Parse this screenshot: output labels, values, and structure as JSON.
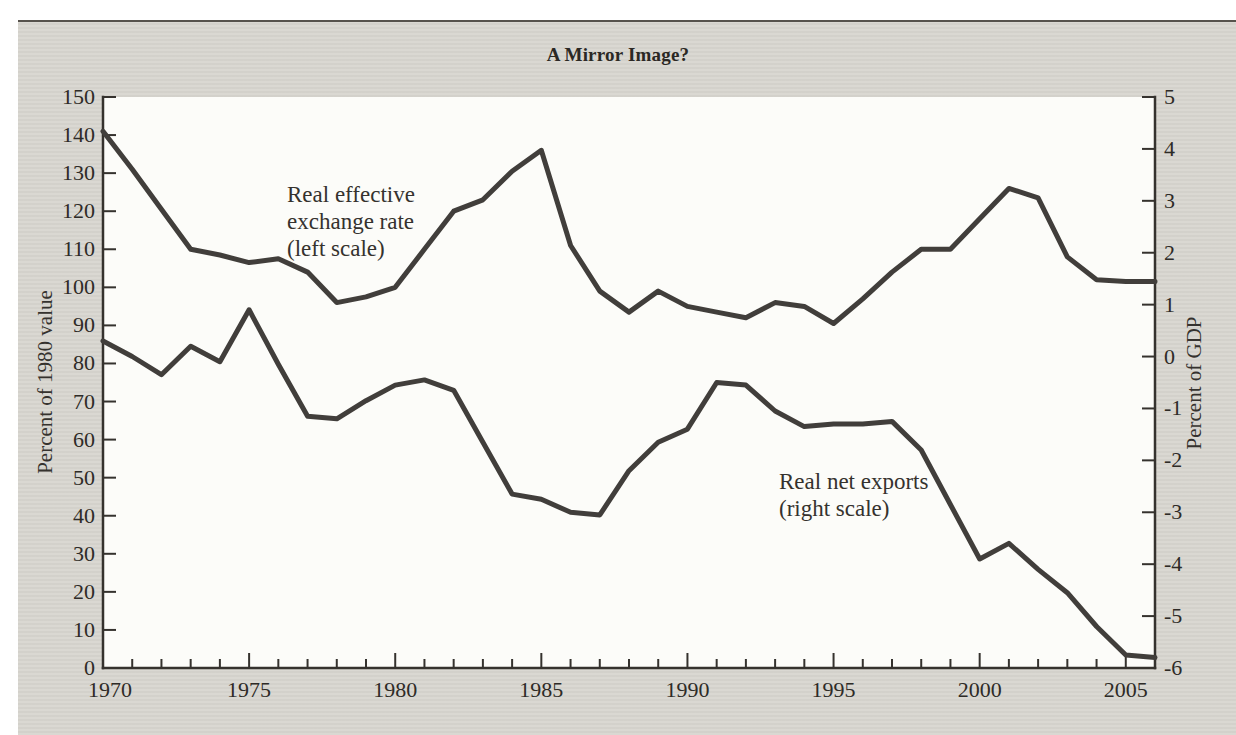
{
  "page": {
    "background": "#ffffff",
    "panel_background": "#d8d6d0",
    "plot_background": "#fcfcf9",
    "rule_color": "#56524c",
    "text_color": "#35322e",
    "line_color": "#413e3b"
  },
  "figure": {
    "title": "A Mirror Image?",
    "left_axis_title": "Percent of 1980 value",
    "right_axis_title": "Percent of GDP",
    "annotation_left_series": "Real effective\nexchange rate\n(left scale)",
    "annotation_right_series": "Real net exports\n(right scale)"
  },
  "chart_data": {
    "type": "line",
    "title": "A Mirror Image?",
    "grid": false,
    "legend_position": "inline-annotations",
    "x": [
      1970,
      1971,
      1972,
      1973,
      1974,
      1975,
      1976,
      1977,
      1978,
      1979,
      1980,
      1981,
      1982,
      1983,
      1984,
      1985,
      1986,
      1987,
      1988,
      1989,
      1990,
      1991,
      1992,
      1993,
      1994,
      1995,
      1996,
      1997,
      1998,
      1999,
      2000,
      2001,
      2002,
      2003,
      2004,
      2005,
      2006
    ],
    "series": [
      {
        "name": "Real effective exchange rate",
        "scale": "left",
        "annotation": "Real effective exchange rate (left scale)",
        "values": [
          141,
          131,
          120.5,
          110,
          108.5,
          106.5,
          107.5,
          104,
          96,
          97.5,
          100,
          110,
          120,
          123,
          130.5,
          136,
          111,
          99,
          93.5,
          99,
          95,
          93.5,
          92,
          96,
          95,
          90.5,
          97,
          104,
          110,
          110,
          118,
          126,
          123.5,
          108,
          102,
          101.5,
          101.5
        ]
      },
      {
        "name": "Real net exports",
        "scale": "right",
        "annotation": "Real net exports (right scale)",
        "values": [
          0.3,
          0,
          -0.35,
          0.2,
          -0.1,
          0.9,
          -0.15,
          -1.15,
          -1.2,
          -0.85,
          -0.55,
          -0.45,
          -0.65,
          -1.65,
          -2.65,
          -2.75,
          -3,
          -3.05,
          -2.2,
          -1.65,
          -1.4,
          -0.5,
          -0.55,
          -1.05,
          -1.35,
          -1.3,
          -1.3,
          -1.25,
          -1.8,
          -2.85,
          -3.9,
          -3.6,
          -4.1,
          -4.55,
          -5.2,
          -5.75,
          -5.8
        ]
      }
    ],
    "left_axis": {
      "label": "Percent of 1980 value",
      "min": 0,
      "max": 150,
      "tick_step": 10
    },
    "right_axis": {
      "label": "Percent of GDP",
      "min": -6,
      "max": 5,
      "tick_step": 1
    },
    "x_axis": {
      "min": 1970,
      "max": 2006,
      "minor_tick_step": 1,
      "labeled_years": [
        1970,
        1975,
        1980,
        1985,
        1990,
        1995,
        2000,
        2005
      ]
    }
  }
}
